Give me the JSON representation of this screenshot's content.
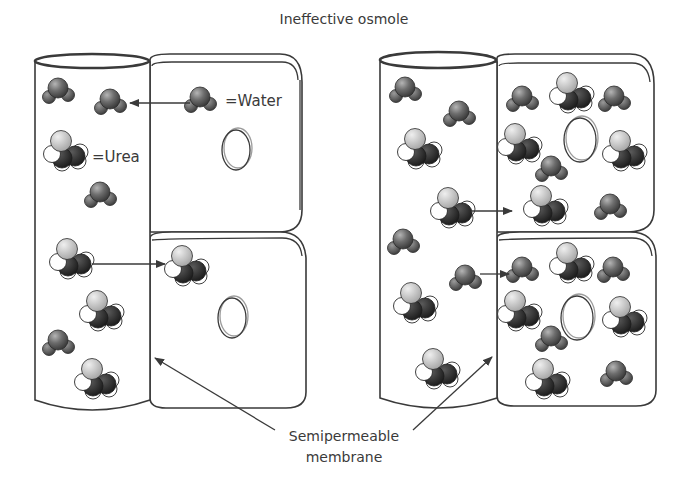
{
  "title": "Ineffective osmole",
  "legend": {
    "water": "=Water",
    "urea": "=Urea"
  },
  "caption": {
    "line1": "Semipermeable",
    "line2": "membrane"
  },
  "colors": {
    "outline": "#3a3a3a",
    "water_oxygen": "#6a6a6a",
    "water_hydrogen": "#555555",
    "urea_light": "#c8c8c8",
    "urea_white": "#ffffff",
    "urea_dark": "#2e2e2e"
  },
  "panels": [
    {
      "name": "left-panel",
      "description": "Urea moves from vessel into cell along with water"
    },
    {
      "name": "right-panel",
      "description": "Equilibrium: urea and water distributed on both sides"
    }
  ]
}
